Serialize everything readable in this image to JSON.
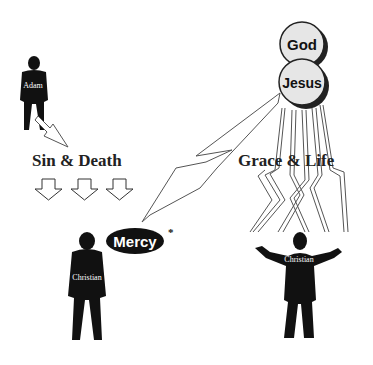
{
  "diagram": {
    "figures": {
      "adam": {
        "label": "Adam"
      },
      "christian_left": {
        "label": "Christian"
      },
      "christian_right": {
        "label": "Christian"
      }
    },
    "headings": {
      "sin_death": "Sin & Death",
      "grace_life": "Grace & Life"
    },
    "circles": {
      "god": "God",
      "jesus": "Jesus"
    },
    "mercy": {
      "label": "Mercy",
      "footnote_mark": "*"
    },
    "colors": {
      "ink": "#111111",
      "circle_fill": "#e6e6e6",
      "arrow_stroke": "#555555",
      "background": "#ffffff"
    }
  }
}
